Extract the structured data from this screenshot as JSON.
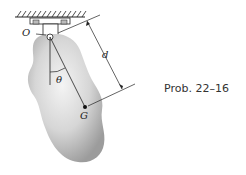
{
  "figure": {
    "labels": {
      "pivot": "O",
      "center_of_gravity": "G",
      "distance": "d",
      "angle": "θ"
    },
    "caption": "Prob. 22–16"
  },
  "colors": {
    "body_light": "#f2f2f2",
    "body_dark": "#9a9a9a",
    "line": "#222222"
  }
}
